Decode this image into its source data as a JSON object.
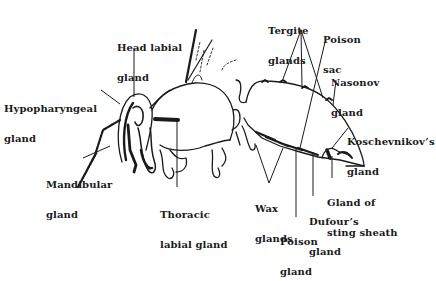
{
  "diagram": {
    "ink_color": "#1a1a1a",
    "background_color": "#ffffff",
    "labels": [
      {
        "id": "head-labial-gland",
        "line1": "Head labial",
        "line2": "gland"
      },
      {
        "id": "hypopharyngeal-gland",
        "line1": "Hypopharyngeal",
        "line2": "gland"
      },
      {
        "id": "mandibular-gland",
        "line1": "Mandibular",
        "line2": "gland"
      },
      {
        "id": "thoracic-labial-gland",
        "line1": "Thoracic",
        "line2": "labial gland"
      },
      {
        "id": "tergite-glands",
        "line1": "Tergite",
        "line2": "glands"
      },
      {
        "id": "poison-sac",
        "line1": "Poison",
        "line2": "sac"
      },
      {
        "id": "nasonov-gland",
        "line1": "Nasonov",
        "line2": "gland"
      },
      {
        "id": "koschevnikov-gland",
        "line1": "Koschevnikov’s",
        "line2": "gland"
      },
      {
        "id": "gland-of-sting-sheath",
        "line1": "Gland of",
        "line2": "sting sheath"
      },
      {
        "id": "dufour-gland",
        "line1": "Dufour’s",
        "line2": "gland"
      },
      {
        "id": "wax-glands",
        "line1": "Wax",
        "line2": "glands"
      },
      {
        "id": "poison-gland",
        "line1": "Poison",
        "line2": "gland"
      }
    ]
  }
}
